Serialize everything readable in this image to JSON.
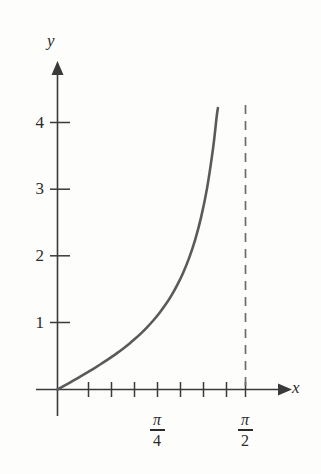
{
  "figure": {
    "background_color": "#fdfdfc",
    "axis_color": "#3a3a3a",
    "curve_color": "#5a5a5a",
    "asymptote_color": "#6b6b6b",
    "text_color": "#2b2b2b",
    "x_axis_label": "x",
    "y_axis_label": "y"
  },
  "chart_data": {
    "type": "line",
    "title": "",
    "xlabel": "x",
    "ylabel": "y",
    "function": "y = tan(x)",
    "xlim": [
      0,
      1.7453292519943295
    ],
    "ylim": [
      0,
      4.3
    ],
    "grid": false,
    "legend": null,
    "x_tick_labels": [
      "π/4",
      "π/2"
    ],
    "x_tick_numerators": [
      "π",
      "π"
    ],
    "x_tick_denominators": [
      "4",
      "2"
    ],
    "x_tick_values": [
      0.7853981633974483,
      1.5707963267948966
    ],
    "x_minor_tick_values": [
      0.19634954084936207,
      0.39269908169872414,
      0.5890486225480862,
      0.9817477042468103,
      1.1780972450961724,
      1.3744467859455345
    ],
    "y_tick_labels": [
      "1",
      "2",
      "3",
      "4"
    ],
    "y_tick_values": [
      1,
      2,
      3,
      4
    ],
    "series": [
      {
        "name": "y = tan(x)",
        "color": "#5a5a5a",
        "style": "solid",
        "x": [
          0.0,
          0.05,
          0.1,
          0.15,
          0.2,
          0.25,
          0.3,
          0.35,
          0.4,
          0.45,
          0.5,
          0.55,
          0.6,
          0.65,
          0.7,
          0.75,
          0.8,
          0.85,
          0.9,
          0.95,
          1.0,
          1.05,
          1.1,
          1.15,
          1.2,
          1.25,
          1.3,
          1.33,
          1.36,
          1.3402
        ],
        "y": [
          0.0,
          0.05,
          0.1003,
          0.1511,
          0.2027,
          0.2553,
          0.3093,
          0.3654,
          0.4228,
          0.4831,
          0.5463,
          0.6131,
          0.6841,
          0.7602,
          0.8423,
          0.9316,
          1.0296,
          1.1383,
          1.2602,
          1.3984,
          1.5574,
          1.7433,
          1.9648,
          2.2345,
          2.5722,
          3.0096,
          3.6021,
          4.0723,
          4.6734,
          4.2
        ]
      }
    ],
    "annotations": [
      {
        "name": "vertical-asymptote",
        "kind": "vertical-dashed-line",
        "x": 1.5707963267948966,
        "label": "x = π/2",
        "color": "#6b6b6b"
      }
    ]
  }
}
